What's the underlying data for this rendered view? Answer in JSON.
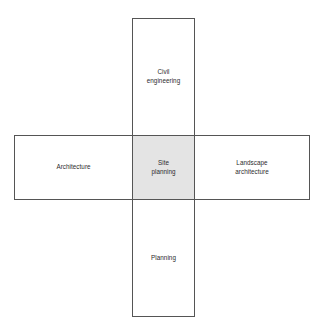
{
  "diagram": {
    "type": "cross-venn-overlap",
    "background_color": "#ffffff",
    "border_color": "#555555",
    "text_color": "#2b2b2b",
    "center_fill_color": "#e4e4e4",
    "arms": {
      "vertical": {
        "top_label": "Civil\nengineering",
        "bottom_label": "Planning"
      },
      "horizontal": {
        "left_label": "Architecture",
        "right_label": "Landscape\narchitecture"
      }
    },
    "center": {
      "label": "Site\nplanning"
    }
  }
}
